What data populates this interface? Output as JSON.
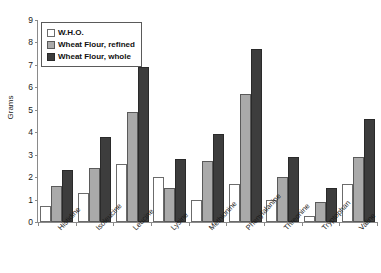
{
  "chart_data": {
    "type": "bar",
    "title": "",
    "xlabel": "",
    "ylabel": "Grams",
    "ylim": [
      0,
      9
    ],
    "yticks": [
      0,
      1,
      2,
      3,
      4,
      5,
      6,
      7,
      8,
      9
    ],
    "grid": false,
    "legend_position": "top-left",
    "categories": [
      "Histidine",
      "Isoleucine",
      "Leucine",
      "Lysine",
      "Methionine",
      "Phenylalanine",
      "Threonine",
      "Tryptophan",
      "Valine"
    ],
    "series": [
      {
        "name": "W.H.O.",
        "color": "#ffffff",
        "values": [
          0.7,
          1.3,
          2.6,
          2.0,
          1.0,
          1.7,
          1.0,
          0.25,
          1.7
        ]
      },
      {
        "name": "Wheat Flour, refined",
        "color": "#aaaaaa",
        "values": [
          1.6,
          2.4,
          4.9,
          1.5,
          2.7,
          5.7,
          2.0,
          0.9,
          2.9
        ]
      },
      {
        "name": "Wheat Flour, whole",
        "color": "#3d3d3d",
        "values": [
          2.3,
          3.8,
          6.9,
          2.8,
          3.9,
          7.7,
          2.9,
          1.5,
          4.6
        ]
      }
    ]
  }
}
